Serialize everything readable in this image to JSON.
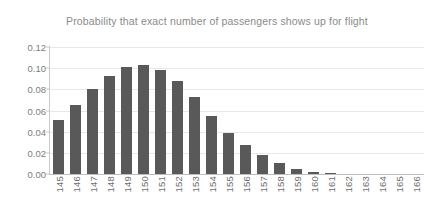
{
  "chart_data": {
    "type": "bar",
    "title": "Probability that exact number of passengers shows up for flight",
    "xlabel": "",
    "ylabel": "",
    "categories": [
      "145",
      "146",
      "147",
      "148",
      "149",
      "150",
      "151",
      "152",
      "153",
      "154",
      "155",
      "156",
      "157",
      "158",
      "159",
      "160",
      "161",
      "162",
      "163",
      "164",
      "165",
      "166"
    ],
    "values": [
      0.051,
      0.065,
      0.08,
      0.093,
      0.101,
      0.103,
      0.098,
      0.088,
      0.073,
      0.055,
      0.039,
      0.027,
      0.018,
      0.01,
      0.005,
      0.002,
      0.001,
      0.0,
      0.0,
      0.0,
      0.0,
      0.0
    ],
    "ylim": [
      0,
      0.12
    ],
    "y_ticks": [
      "0.00",
      "0.02",
      "0.04",
      "0.06",
      "0.08",
      "0.10",
      "0.12"
    ],
    "y_tick_values": [
      0.0,
      0.02,
      0.04,
      0.06,
      0.08,
      0.1,
      0.12
    ],
    "grid": true,
    "legend": false,
    "legend_position": "none",
    "bar_color": "#595959",
    "gridline_color": "#e8e8e8",
    "axis_color": "#c9c9c9",
    "title_color": "#8a8a8a",
    "tick_label_color": "#6e6e6e",
    "background_color": "#ffffff"
  }
}
